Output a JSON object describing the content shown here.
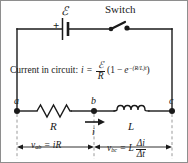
{
  "figure": {
    "colors": {
      "wire": "#1a1a1a",
      "text": "#1a1a1a",
      "dashed_guide": "#9a9a9a",
      "frame_border": "#8e8e8e",
      "background": "#ffffff"
    }
  },
  "labels": {
    "emf": "ℰ",
    "plus_terminal": "+",
    "switch": "Switch",
    "node_a": "a",
    "node_b": "b",
    "node_c": "c",
    "resistor": "R",
    "inductor": "L",
    "current_arrow": "i"
  },
  "equations": {
    "current_caption": "Current in circuit:",
    "current_lhs": "i",
    "equals": "=",
    "emf_over_R_num": "ℰ",
    "emf_over_R_den": "R",
    "paren_open": "(1",
    "minus": "−",
    "exp_base": "e",
    "exp_power": "−(R/L)t",
    "paren_close": ")",
    "v_ab_label": "v",
    "v_ab_sub": "ab",
    "v_ab_equals": "=",
    "v_ab_rhs": "iR",
    "v_bc_label": "v",
    "v_bc_sub": "bc",
    "v_bc_equals": "=",
    "v_bc_L": "L",
    "v_bc_num": "Δi",
    "v_bc_den": "Δt"
  }
}
